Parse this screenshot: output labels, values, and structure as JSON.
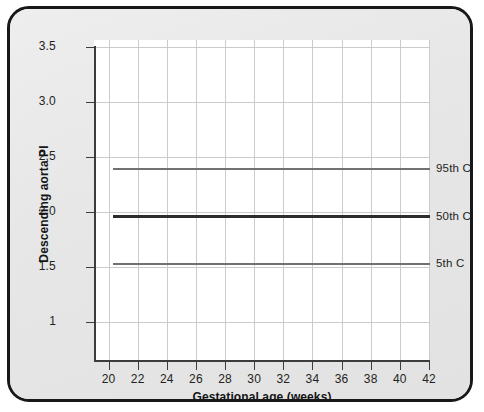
{
  "figure": {
    "background_color": "#e8e8e8",
    "border_color": "#17181a",
    "plot_background": "#ffffff",
    "grid_color": "#c9cbcd"
  },
  "chart_data": {
    "type": "line",
    "title": "",
    "xlabel": "Gestational age (weeks)",
    "ylabel": "Descending aorta PI",
    "xlim": [
      19,
      42
    ],
    "ylim": [
      0.65,
      3.5
    ],
    "grid": true,
    "legend_position": "right-of-plot-inline",
    "x_ticks": [
      20,
      22,
      24,
      26,
      28,
      30,
      32,
      34,
      36,
      38,
      40,
      42
    ],
    "x_tick_labels": [
      "20",
      "22",
      "24",
      "26",
      "28",
      "30",
      "32",
      "34",
      "36",
      "38",
      "40",
      "42"
    ],
    "y_ticks": [
      1,
      1.5,
      2.0,
      2.5,
      3.0,
      3.5
    ],
    "y_tick_labels": [
      "1",
      "1.5",
      "2.0",
      "2.5",
      "3.0",
      "3.5"
    ],
    "x": [
      20,
      22,
      24,
      26,
      28,
      30,
      32,
      34,
      36,
      38,
      40,
      42
    ],
    "series": [
      {
        "name": "95th C",
        "label": "95th C",
        "color": "#6f7173",
        "line_width": 2,
        "values": [
          2.39,
          2.39,
          2.39,
          2.39,
          2.39,
          2.39,
          2.39,
          2.39,
          2.39,
          2.39,
          2.39,
          2.39
        ]
      },
      {
        "name": "50th C",
        "label": "50th C",
        "color": "#2b2d2f",
        "line_width": 3,
        "values": [
          1.96,
          1.96,
          1.96,
          1.96,
          1.96,
          1.96,
          1.96,
          1.96,
          1.96,
          1.96,
          1.96,
          1.96
        ]
      },
      {
        "name": "5th C",
        "label": "5th C",
        "color": "#6f7173",
        "line_width": 2,
        "values": [
          1.53,
          1.53,
          1.53,
          1.53,
          1.53,
          1.53,
          1.53,
          1.53,
          1.53,
          1.53,
          1.53,
          1.53
        ]
      }
    ]
  }
}
